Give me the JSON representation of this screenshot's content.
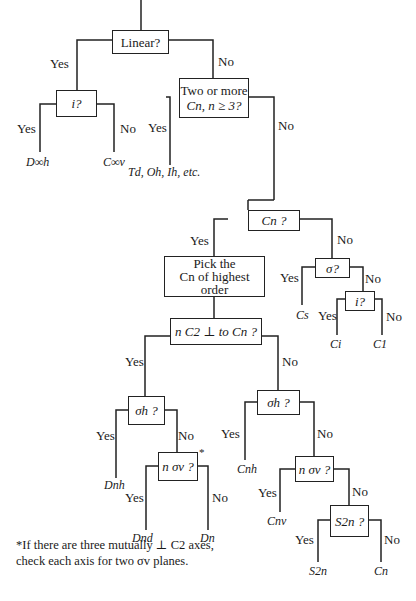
{
  "diagram": {
    "nodes": {
      "linear": "Linear?",
      "i1": "i?",
      "two_cn_line1": "Two or more",
      "two_cn_line2": "Cn, n ≥ 3?",
      "cn": "Cn ?",
      "pick_line1": "Pick the",
      "pick_line2": "Cn of highest",
      "pick_line3": "order",
      "nc2": "n C2 ⊥ to Cn ?",
      "sigma": "σ?",
      "i2": "i?",
      "sigma_h_left": "σh ?",
      "n_sigma_v_left": "n σv ?",
      "sigma_h_right": "σh ?",
      "n_sigma_v_right": "n σv ?",
      "s2n": "S2n ?"
    },
    "leaves": {
      "d_inf_h": "D∞h",
      "c_inf_v": "C∞v",
      "cubic": "Td, Oh, Ih, etc.",
      "cs": "Cs",
      "ci": "Ci",
      "c1": "C1",
      "dnh": "Dnh",
      "dnd": "Dnd",
      "dn": "Dn",
      "cnh": "Cnh",
      "cnv": "Cnv",
      "s2n": "S2n",
      "cn": "Cn"
    },
    "edge_labels": {
      "yes": "Yes",
      "no": "No"
    },
    "footnote_marker": "*",
    "footnote_line1": "*If there are three mutually ⊥ C2 axes,",
    "footnote_line2": "check each axis for two σv planes."
  }
}
